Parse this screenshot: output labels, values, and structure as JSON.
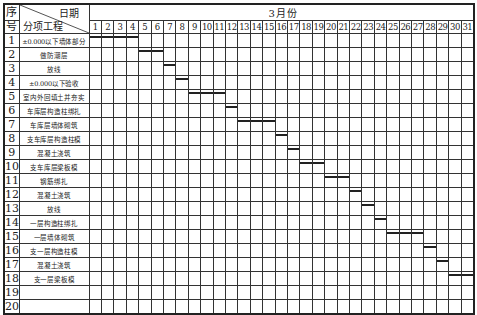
{
  "chart_data": {
    "type": "gantt",
    "title": "",
    "header": {
      "seq_label_top": "序",
      "seq_label_bottom": "号",
      "date_label": "日期",
      "task_label": "分项工程",
      "month_label": "3月份"
    },
    "days": [
      1,
      2,
      3,
      4,
      5,
      6,
      7,
      8,
      9,
      10,
      11,
      12,
      13,
      14,
      15,
      16,
      17,
      18,
      19,
      20,
      21,
      22,
      23,
      24,
      25,
      26,
      27,
      28,
      29,
      30,
      31
    ],
    "tasks": [
      {
        "seq": "1",
        "name": "±0.000以下墙体部分",
        "start": 1,
        "end": 4
      },
      {
        "seq": "2",
        "name": "做防潮层",
        "start": 5,
        "end": 6
      },
      {
        "seq": "3",
        "name": "放线",
        "start": 7,
        "end": 7
      },
      {
        "seq": "4",
        "name": "±0.000以下验收",
        "start": 8,
        "end": 8
      },
      {
        "seq": "5",
        "name": "室内外回填土并夯实",
        "start": 9,
        "end": 11
      },
      {
        "seq": "6",
        "name": "车库层构造柱绑扎",
        "start": 12,
        "end": 12
      },
      {
        "seq": "7",
        "name": "车库层墙体砌筑",
        "start": 13,
        "end": 15
      },
      {
        "seq": "8",
        "name": "支车库层构造柱模",
        "start": 16,
        "end": 16
      },
      {
        "seq": "9",
        "name": "混凝土浇筑",
        "start": 17,
        "end": 17
      },
      {
        "seq": "10",
        "name": "支车库层梁板模",
        "start": 18,
        "end": 19
      },
      {
        "seq": "11",
        "name": "钢筋绑扎",
        "start": 20,
        "end": 21
      },
      {
        "seq": "12",
        "name": "混凝土浇筑",
        "start": 22,
        "end": 22
      },
      {
        "seq": "13",
        "name": "放线",
        "start": 23,
        "end": 23
      },
      {
        "seq": "14",
        "name": "一层构造柱绑扎",
        "start": 24,
        "end": 24
      },
      {
        "seq": "15",
        "name": "一层墙体砌筑",
        "start": 25,
        "end": 27
      },
      {
        "seq": "16",
        "name": "支一层构造柱模",
        "start": 28,
        "end": 28
      },
      {
        "seq": "17",
        "name": "混凝土浇筑",
        "start": 29,
        "end": 29
      },
      {
        "seq": "18",
        "name": "支一层梁板模",
        "start": 30,
        "end": 31
      },
      {
        "seq": "19",
        "name": "",
        "start": null,
        "end": null
      },
      {
        "seq": "20",
        "name": "",
        "start": null,
        "end": null
      }
    ],
    "xlabel": "3月份",
    "ylabel": "分项工程",
    "grid": true,
    "legend": null
  },
  "style": {
    "bar_color": "#222222",
    "grid_color": "#333333"
  }
}
